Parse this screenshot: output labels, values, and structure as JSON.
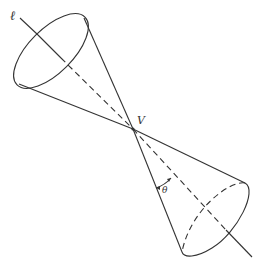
{
  "diagram": {
    "labels": {
      "axis": "ℓ",
      "vertex": "V",
      "angle": "θ"
    },
    "colors": {
      "line": "#333333",
      "background": "#ffffff"
    }
  }
}
